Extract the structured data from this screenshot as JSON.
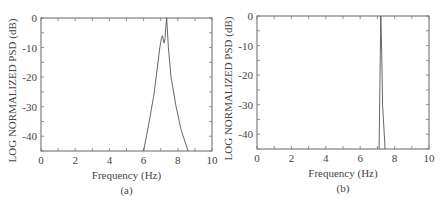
{
  "chart_data": [
    {
      "type": "line",
      "caption": "(a)",
      "title": "",
      "xlabel": "Frequency (Hz)",
      "ylabel": "LOG NORMALIZED PSD (dB)",
      "xlim": [
        0,
        10
      ],
      "ylim": [
        -45,
        0
      ],
      "xticks": [
        0,
        2,
        4,
        6,
        8,
        10
      ],
      "yticks": [
        0,
        -10,
        -20,
        -30,
        -40
      ],
      "grid": false,
      "series": [
        {
          "name": "PSD",
          "x": [
            6.0,
            6.3,
            6.6,
            6.8,
            6.95,
            7.05,
            7.1,
            7.2,
            7.25,
            7.3,
            7.35,
            7.45,
            7.6,
            7.9,
            8.2,
            8.6
          ],
          "y": [
            -45,
            -36,
            -26,
            -17,
            -10,
            -6.5,
            -6,
            -8.5,
            -7,
            -3,
            0,
            -10,
            -20,
            -30,
            -38,
            -45
          ]
        }
      ]
    },
    {
      "type": "line",
      "caption": "(b)",
      "title": "",
      "xlabel": "Frequency (Hz)",
      "ylabel": "LOG NORMALIZED PSD (dB)",
      "xlim": [
        0,
        10
      ],
      "ylim": [
        -45,
        0
      ],
      "xticks": [
        0,
        2,
        4,
        6,
        8,
        10
      ],
      "yticks": [
        0,
        -10,
        -20,
        -30,
        -40
      ],
      "grid": false,
      "series": [
        {
          "name": "PSD",
          "x": [
            7.1,
            7.2,
            7.25,
            7.3,
            7.45
          ],
          "y": [
            -45,
            0,
            -12,
            -30,
            -45
          ]
        }
      ]
    }
  ]
}
